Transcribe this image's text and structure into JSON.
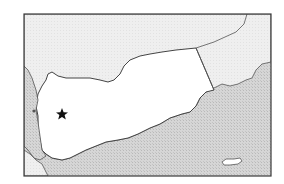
{
  "map": {
    "subject": "Yemen locator map",
    "marker": {
      "type": "star",
      "label": "capital",
      "x": 62,
      "y": 114
    },
    "colors": {
      "background": "#ffffff",
      "frame": "#3a3a3a",
      "highlighted_country": "#ffffff",
      "neighbor_land": "#ececec",
      "sea": "#cfcfcf",
      "border_line": "#555555",
      "marker": "#111111"
    }
  }
}
